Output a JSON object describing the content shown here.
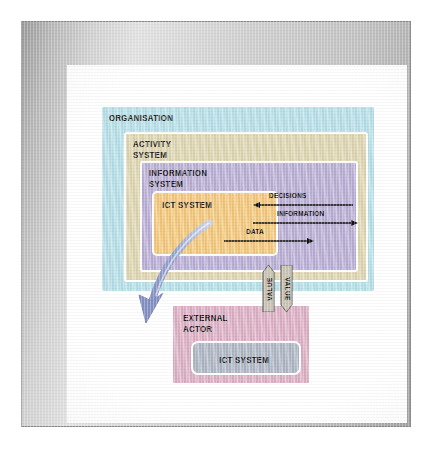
{
  "diagram": {
    "boxes": {
      "organisation": {
        "label": "ORGANISATION",
        "color": "#b6dfe8"
      },
      "activity_system": {
        "label": "ACTIVITY\nSYSTEM",
        "color": "#ded5b0"
      },
      "information_system": {
        "label": "INFORMATION\nSYSTEM",
        "color": "#b9aed4"
      },
      "ict_system_inner": {
        "label": "ICT SYSTEM",
        "color": "#f3c77a"
      },
      "external_actor": {
        "label": "EXTERNAL\nACTOR",
        "color": "#dcafc4"
      },
      "ict_system_external": {
        "label": "ICT SYSTEM",
        "color": "#aeb6c4"
      }
    },
    "flows": [
      {
        "label": "DECISIONS",
        "direction": "left"
      },
      {
        "label": "INFORMATION",
        "direction": "right"
      },
      {
        "label": "DATA",
        "direction": "right"
      }
    ],
    "value_arrows": [
      {
        "label": "VALUE",
        "direction": "up"
      },
      {
        "label": "VALUE",
        "direction": "down"
      }
    ],
    "curved_arrow": {
      "name": "ict-to-external-actor-arrow",
      "color": "#9aa6cf",
      "direction": "down-left"
    },
    "colors": {
      "frame": "#b6b6b6",
      "canvas": "#ffffff",
      "box_border": "#ffffff",
      "arrow": "#111111"
    }
  }
}
